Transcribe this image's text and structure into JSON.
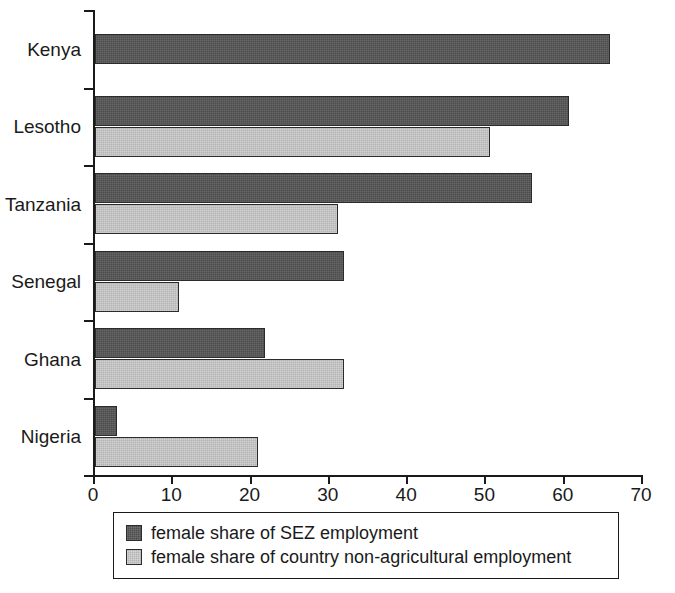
{
  "chart_data": {
    "type": "bar",
    "orientation": "horizontal",
    "title": "",
    "xlabel": "",
    "ylabel": "",
    "xlim": [
      0,
      70
    ],
    "xticks": [
      0,
      10,
      20,
      30,
      40,
      50,
      60,
      70
    ],
    "xtick_labels": [
      "0",
      "10",
      "20",
      "30",
      "40",
      "50",
      "60",
      "70"
    ],
    "grid": false,
    "legend_position": "bottom",
    "categories": [
      "Kenya",
      "Lesotho",
      "Tanzania",
      "Senegal",
      "Ghana",
      "Nigeria"
    ],
    "series": [
      {
        "name": "female share of SEZ employment",
        "key": "sez",
        "color": "#4d4d4d",
        "values": [
          65.8,
          60.5,
          55.8,
          31.8,
          21.7,
          2.8
        ]
      },
      {
        "name": "female share of country non-agricultural employment",
        "key": "nonag",
        "color": "#b3b3b3",
        "values": [
          null,
          50.5,
          31.0,
          10.7,
          31.8,
          20.8
        ]
      }
    ]
  },
  "legend": {
    "items": [
      {
        "label": "female share of SEZ employment",
        "key": "sez"
      },
      {
        "label": "female share of country non-agricultural employment",
        "key": "nonag"
      }
    ]
  },
  "colors": {
    "series_sez": "#4d4d4d",
    "series_nonag": "#b3b3b3",
    "axis": "#1a1a1a",
    "background": "#ffffff"
  }
}
